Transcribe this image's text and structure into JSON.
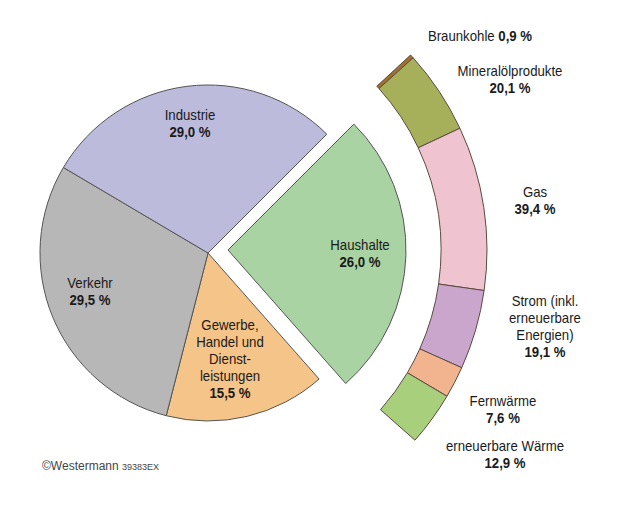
{
  "chart_data": [
    {
      "type": "pie",
      "title": "",
      "categories": [
        "Haushalte",
        "Gewerbe, Handel und Dienstleistungen",
        "Verkehr",
        "Industrie"
      ],
      "values": [
        26.0,
        15.5,
        29.5,
        29.0
      ],
      "labels": [
        "26,0 %",
        "15,5 %",
        "29,5 %",
        "29,0 %"
      ],
      "colors": [
        "#a9d3a2",
        "#f4c489",
        "#b7b7b7",
        "#bdbbdc"
      ],
      "exploded": "Haushalte"
    },
    {
      "type": "pie",
      "subtype": "partial-ring-breakdown",
      "of": "Haushalte",
      "categories": [
        "Braunkohle",
        "Mineralölprodukte",
        "Gas",
        "Strom (inkl. erneuerbare Energien)",
        "Fernwärme",
        "erneuerbare Wärme"
      ],
      "values": [
        0.9,
        20.1,
        39.4,
        19.1,
        7.6,
        12.9
      ],
      "labels": [
        "0,9 %",
        "20,1 %",
        "39,4 %",
        "19,1 %",
        "7,6 %",
        "12,9 %"
      ],
      "colors": [
        "#a0702c",
        "#a6b05a",
        "#efc3cf",
        "#caa6cc",
        "#f2b48e",
        "#a8cf7c"
      ]
    }
  ],
  "labels": {
    "industrie": {
      "name": "Industrie",
      "value": "29,0 %"
    },
    "verkehr": {
      "name": "Verkehr",
      "value": "29,5 %"
    },
    "gewerbe": {
      "line1": "Gewerbe,",
      "line2": "Handel und",
      "line3": "Dienst-",
      "line4": "leistungen",
      "value": "15,5 %"
    },
    "haushalte": {
      "name": "Haushalte",
      "value": "26,0 %"
    },
    "braunkohle": {
      "name": "Braunkohle",
      "value": "0,9 %"
    },
    "mineral": {
      "name": "Mineralölprodukte",
      "value": "20,1 %"
    },
    "gas": {
      "name": "Gas",
      "value": "39,4 %"
    },
    "strom": {
      "line1": "Strom (inkl.",
      "line2": "erneuerbare",
      "line3": "Energien)",
      "value": "19,1 %"
    },
    "fernwaerme": {
      "name": "Fernwärme",
      "value": "7,6 %"
    },
    "erneuerbar": {
      "name": "erneuerbare Wärme",
      "value": "12,9 %"
    }
  },
  "copyright": {
    "text": "©Westermann",
    "code": "39383EX"
  }
}
